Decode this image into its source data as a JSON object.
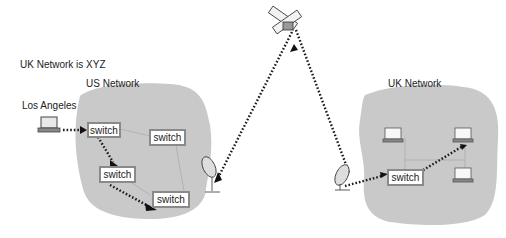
{
  "labels": {
    "caption": "UK Network is XYZ",
    "us_network": "US Network",
    "uk_network": "UK Network",
    "los_angeles": "Los Angeles"
  },
  "us_switches": [
    {
      "label": "switch"
    },
    {
      "label": "switch"
    },
    {
      "label": "switch"
    },
    {
      "label": "switch"
    }
  ],
  "uk_switches": [
    {
      "label": "switch"
    }
  ],
  "icons": [
    "laptop-icon",
    "satellite-dish-icon",
    "satellite-icon",
    "desktop-computer-icon"
  ],
  "colors": {
    "cloud_fill": "#c9c9c9",
    "switch_border": "#8a8a8a",
    "path": "#1a1a1a"
  }
}
